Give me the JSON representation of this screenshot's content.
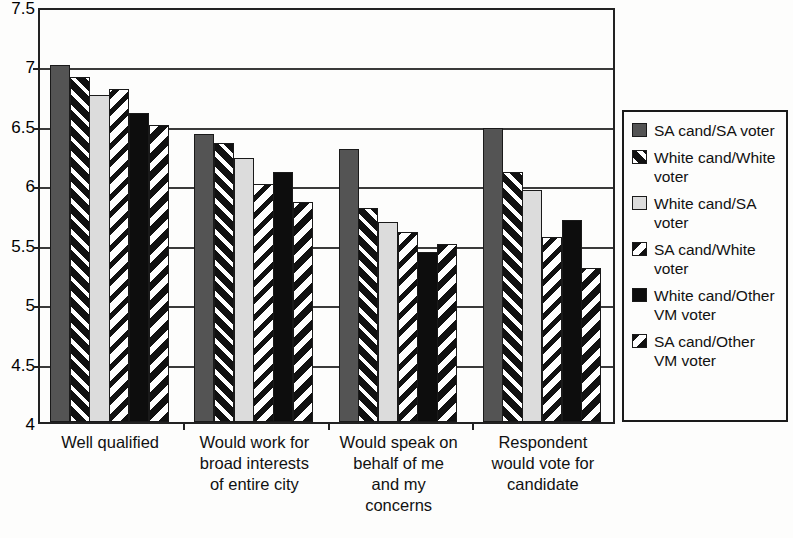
{
  "chart_data": {
    "type": "bar",
    "title": "",
    "subtitle": "",
    "xlabel": "",
    "ylabel": "",
    "ylim": [
      4,
      7.5
    ],
    "ytick_values": [
      7.5,
      7,
      6.5,
      6,
      5.5,
      5,
      4.5,
      4
    ],
    "ytick_labels": [
      "7.5",
      "7",
      "6.5",
      "6",
      "5.5",
      "5",
      "4.5",
      "4"
    ],
    "grid": true,
    "grid_axis": "y",
    "legend_position": "right",
    "categories": [
      "Well qualified",
      "Would work for broad interests of entire city",
      "Would speak on behalf of me and my concerns",
      "Respondent would vote for candidate"
    ],
    "category_lines": [
      [
        "Well qualified"
      ],
      [
        "Would work for",
        "broad interests",
        "of entire city"
      ],
      [
        "Would speak on",
        "behalf of me",
        "and my",
        "concerns"
      ],
      [
        "Respondent",
        "would vote for",
        "candidate"
      ]
    ],
    "series": [
      {
        "name": "SA cand/SA voter",
        "name_lines": [
          "SA cand/SA voter"
        ],
        "pattern": "solid-dark-gray",
        "color": "#545454",
        "values": [
          7.0,
          6.42,
          6.3,
          6.47
        ]
      },
      {
        "name": "White cand/White voter",
        "name_lines": [
          "White cand/White",
          "voter"
        ],
        "pattern": "black-with-white-diagonal-stripes",
        "color": "#111111",
        "values": [
          6.9,
          6.35,
          5.8,
          6.1
        ]
      },
      {
        "name": "White cand/SA voter",
        "name_lines": [
          "White cand/SA",
          "voter"
        ],
        "pattern": "solid-light-gray",
        "color": "#dcdcdc",
        "values": [
          6.75,
          6.22,
          5.68,
          5.95
        ]
      },
      {
        "name": "SA cand/White voter",
        "name_lines": [
          "SA cand/White",
          "voter"
        ],
        "pattern": "white-with-black-thin-diagonal-stripes",
        "color": "#ffffff",
        "values": [
          6.8,
          6.0,
          5.6,
          5.56
        ]
      },
      {
        "name": "White cand/Other VM voter",
        "name_lines": [
          "White cand/Other",
          "VM voter"
        ],
        "pattern": "solid-black",
        "color": "#0d0d0d",
        "values": [
          6.6,
          6.1,
          5.43,
          5.7
        ]
      },
      {
        "name": "SA cand/Other VM voter",
        "name_lines": [
          "SA cand/Other",
          "VM voter"
        ],
        "pattern": "white-with-black-thick-diagonal-stripes",
        "color": "#ffffff",
        "values": [
          6.5,
          5.85,
          5.5,
          5.3
        ]
      }
    ]
  }
}
